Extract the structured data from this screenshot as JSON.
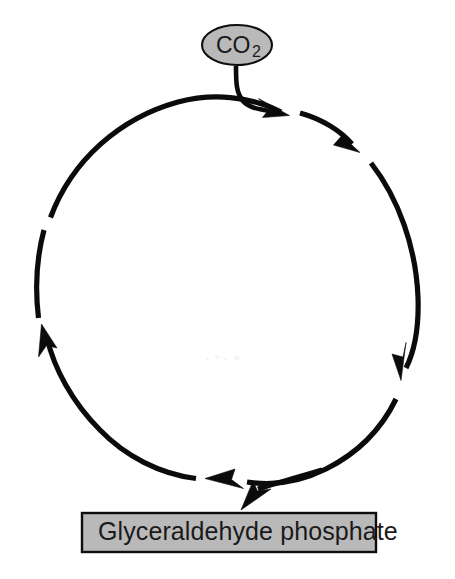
{
  "diagram": {
    "background_color": "#ffffff",
    "stroke_color": "#0b0b0b",
    "node_fill_color": "#b9b9b9",
    "node_border_color": "#0e0e0e",
    "cycle": {
      "direction": "clockwise",
      "center_x": 228,
      "center_y": 300,
      "radius": 196,
      "segment_count": 4,
      "segments": [
        {
          "name": "top-segment",
          "from_deg": 205,
          "to_deg": 283,
          "arrow": "arrowhead-top"
        },
        {
          "name": "upper-right-segment",
          "from_deg": 289,
          "to_deg": 339,
          "arrow": "arrowhead-upper-right"
        },
        {
          "name": "right-segment",
          "from_deg": 344,
          "to_deg": 64,
          "arrow": "arrowhead-lower-right"
        },
        {
          "name": "bottom-left-segment",
          "from_deg": 72,
          "to_deg": 182,
          "arrow": "arrowhead-left"
        }
      ]
    },
    "input_node": {
      "id": "co2-node",
      "shape": "ellipse",
      "label": "CO",
      "subscript": "2",
      "full_label": "CO2",
      "center_x": 237,
      "center_y": 45,
      "rx": 35,
      "ry": 20,
      "fill": "#b9b9b9",
      "border": "#0e0e0e"
    },
    "output_node": {
      "id": "glyceraldehyde-phosphate-node",
      "shape": "rectangle",
      "label": "Glyceraldehyde phosphate",
      "x": 82,
      "y": 513,
      "width": 294,
      "height": 39,
      "fill": "#b9b9b9",
      "border": "#0e0e0e"
    },
    "connectors": [
      {
        "name": "co2-input-connector",
        "from": "co2-node",
        "to": "cycle-top",
        "arrow": true,
        "label": ""
      },
      {
        "name": "glyceraldehyde-output-connector",
        "from": "cycle-bottom",
        "to": "glyceraldehyde-phosphate-node",
        "arrow": true,
        "label": ""
      }
    ]
  }
}
